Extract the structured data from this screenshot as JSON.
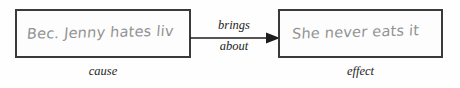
{
  "diagram": {
    "type": "cause-effect-flow",
    "background_color": "#fefefe",
    "box_border_color": "#3a3a3a",
    "handwriting_color": "#8d8d8d",
    "label_color": "#1d1d1d",
    "cause": {
      "handwritten_text": "Bec. Jenny hates liv",
      "caption": "cause"
    },
    "effect": {
      "handwritten_text": "She never eats it",
      "caption": "effect"
    },
    "connector": {
      "icon": "right-arrow-icon",
      "label_line1": "brings",
      "label_line2": "about"
    }
  }
}
